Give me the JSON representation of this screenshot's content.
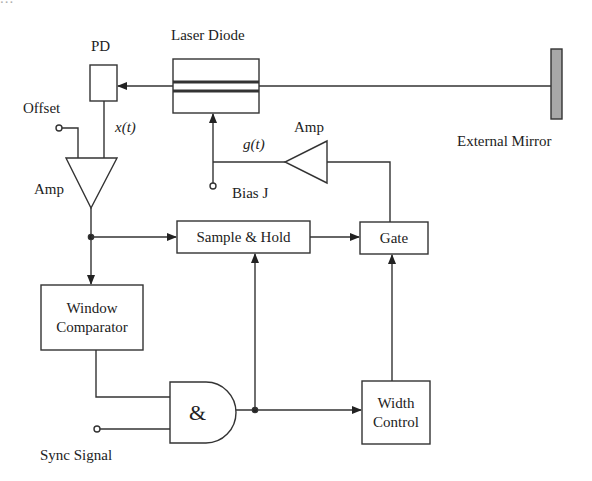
{
  "header": {
    "cropped_text": "..."
  },
  "diagram": {
    "labels": {
      "pd": "PD",
      "laser_diode": "Laser Diode",
      "external_mirror": "External Mirror",
      "offset": "Offset",
      "x_t": "x(t)",
      "g_t": "g(t)",
      "amp_left": "Amp",
      "amp_right": "Amp",
      "bias": "Bias J",
      "sync_signal": "Sync Signal"
    },
    "blocks": {
      "sample_hold": "Sample & Hold",
      "gate": "Gate",
      "window_comparator_line1": "Window",
      "window_comparator_line2": "Comparator",
      "and_gate": "&",
      "width_control_line1": "Width",
      "width_control_line2": "Control"
    },
    "colors": {
      "stroke": "#333333",
      "mirror_fill": "#a8a8a8"
    }
  }
}
